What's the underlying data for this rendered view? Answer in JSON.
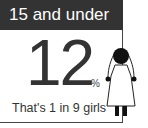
{
  "header": {
    "title": "15 and under"
  },
  "stat": {
    "value": "12",
    "unit": "%",
    "caption": "That's 1 in 9 girls"
  },
  "figure": {
    "icon": "girl-figure-icon"
  },
  "colors": {
    "header_bg": "#333333",
    "header_text": "#ffffff",
    "text": "#333333",
    "border": "#444444"
  }
}
